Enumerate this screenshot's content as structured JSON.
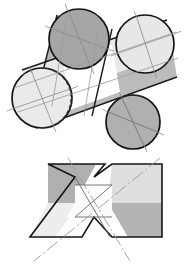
{
  "drawing": {
    "title": "Intersecting Cylinders — Pictorial and Orthographic Views",
    "background_color": "#ffffff",
    "outline_color": "#1a1a1a",
    "centerline_color": "#9a9a9a",
    "views": [
      {
        "id": "pictorial",
        "name": "Isometric Pictorial View",
        "description": "Two cylinders intersecting at an oblique angle, four circular end faces visible"
      },
      {
        "id": "orthographic",
        "name": "Orthographic X View",
        "description": "Front view of the two intersecting prisms forming an X outline with V notches top and bottom"
      }
    ],
    "fills": {
      "dark_gray": "#a6a6a6",
      "mid_gray": "#b4b4b4",
      "light_gray": "#e2e2e2",
      "pale_gray": "#eeeeee",
      "white": "#ffffff"
    },
    "pictorial": {
      "faces": [
        {
          "name": "top-left-end-circle",
          "cx": 79,
          "cy": 39,
          "r": 30,
          "fill": "#a6a6a6",
          "note": "near end face of cylinder A, dark"
        },
        {
          "name": "top-right-end-circle",
          "cx": 145,
          "cy": 44,
          "r": 29,
          "fill": "#e7e7e7",
          "note": "far end face of cylinder B, light"
        },
        {
          "name": "bottom-left-end-circle",
          "cx": 42,
          "cy": 98,
          "r": 30,
          "fill": "#eaeaea",
          "note": "far end face of cylinder A, light, hidden arc dashed"
        },
        {
          "name": "bottom-right-end-circle",
          "cx": 133,
          "cy": 122,
          "r": 27,
          "fill": "#b0b0b0",
          "note": "near end face of cylinder B, mid gray, hidden arc dashed"
        }
      ],
      "bands": [
        {
          "name": "cylinder-a-upper-band",
          "fill": "#b0b0b0"
        },
        {
          "name": "cylinder-a-lower-band",
          "fill": "#ffffff"
        },
        {
          "name": "cylinder-b-upper-band",
          "fill": "#e4e4e4"
        },
        {
          "name": "cylinder-b-lower-band",
          "fill": "#b6b6b6"
        },
        {
          "name": "intersection-patch",
          "fill": "#ffffff"
        }
      ],
      "centerlines": 4,
      "hidden_edge_style": "dashed"
    },
    "orthographic": {
      "regions": [
        {
          "name": "upper-left-arm",
          "fill": "#b0b0b0"
        },
        {
          "name": "upper-right-arm",
          "fill": "#dedede"
        },
        {
          "name": "lower-left-arm",
          "fill": "#ededed"
        },
        {
          "name": "lower-right-arm",
          "fill": "#b4b4b4"
        },
        {
          "name": "center-crossing-square",
          "fill": "#fbfbfb"
        }
      ],
      "notch_top": "V notch",
      "notch_bottom": "inverted V notch",
      "centerlines": 2,
      "centerline_style": "dash-dot"
    }
  }
}
